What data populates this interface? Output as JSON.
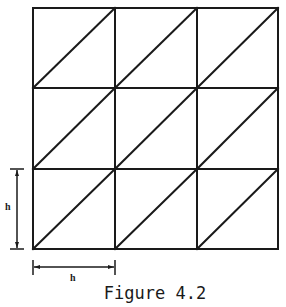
{
  "figure": {
    "caption": "Figure 4.2",
    "grid": {
      "rows": 3,
      "cols": 3,
      "diagonal": "bottom-left to top-right in every cell",
      "line_color": "#1a1a1a",
      "x": [
        33,
        115,
        197,
        278
      ],
      "y": [
        8,
        88,
        169,
        249
      ]
    },
    "dimensions": {
      "vertical_label": "h",
      "horizontal_label": "h"
    }
  }
}
